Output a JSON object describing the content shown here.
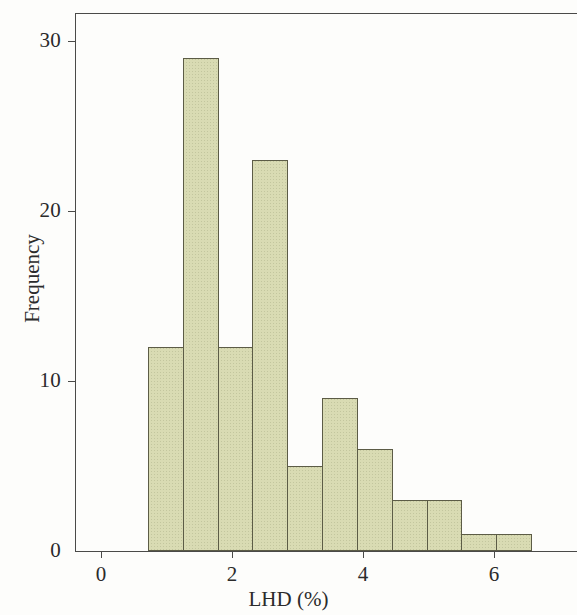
{
  "chart_data": {
    "type": "bar",
    "title": "",
    "subtitle": "",
    "xlabel": "LHD (%)",
    "ylabel": "Frequency",
    "xlim": [
      -0.35,
      7.26
    ],
    "ylim": [
      0,
      31.7
    ],
    "grid": false,
    "legend": null,
    "x_ticks": [
      0,
      2,
      4,
      6
    ],
    "x_tick_labels": [
      "0",
      "2",
      "4",
      "6"
    ],
    "y_ticks": [
      0,
      10,
      20,
      30
    ],
    "y_tick_labels": [
      "0",
      "10",
      "20",
      "30"
    ],
    "bin_edges": [
      0.72,
      1.25,
      1.78,
      2.31,
      2.84,
      3.38,
      3.91,
      4.44,
      4.97,
      5.5,
      6.03,
      6.56
    ],
    "bin_width": 0.53,
    "categories": [
      "0.72-1.25",
      "1.25-1.78",
      "1.78-2.31",
      "2.31-2.84",
      "2.84-3.38",
      "3.38-3.91",
      "3.91-4.44",
      "4.44-4.97",
      "4.97-5.50",
      "5.50-6.03",
      "6.03-6.56"
    ],
    "values": [
      12,
      29,
      12,
      23,
      5,
      9,
      6,
      3,
      3,
      1,
      1
    ],
    "total_count": 104,
    "bar_fill_color": "#d9dbb3",
    "bar_edge_color": "#5c5c46",
    "axis_color": "#4a4a48"
  },
  "axes": {
    "y_label": "Frequency",
    "x_label": "LHD (%)"
  }
}
